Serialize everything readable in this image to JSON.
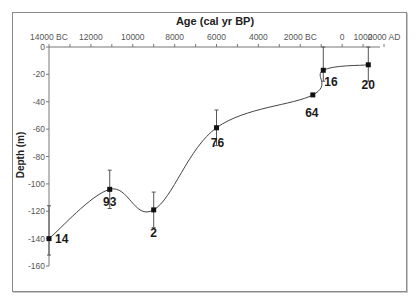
{
  "chart_data": {
    "type": "line",
    "title": "Age (cal yr BP)",
    "xlabel": "Age (cal yr BP)",
    "ylabel": "Depth (m)",
    "x_tick_labels": [
      "14000 BC",
      "12000",
      "10000",
      "8000",
      "6000",
      "4000",
      "2000 BC",
      "0",
      "1000",
      "2000 AD"
    ],
    "x_tick_values": [
      -14000,
      -12000,
      -10000,
      -8000,
      -6000,
      -4000,
      -2000,
      0,
      1000,
      2000
    ],
    "y_tick_labels": [
      "0",
      "-20",
      "-40",
      "-60",
      "-80",
      "-100",
      "-120",
      "-140",
      "-160"
    ],
    "y_tick_values": [
      0,
      -20,
      -40,
      -60,
      -80,
      -100,
      -120,
      -140,
      -160
    ],
    "xlim": [
      -14000,
      2000
    ],
    "ylim": [
      -160,
      0
    ],
    "x_axis_position": "top",
    "grid": false,
    "smoothed": true,
    "series": [
      {
        "name": "Relative sea level",
        "points": [
          {
            "label": "14",
            "x": -14000,
            "y": -140,
            "err_low": -152,
            "err_high": -116
          },
          {
            "label": "93",
            "x": -11100,
            "y": -104,
            "err_low": -118,
            "err_high": -90
          },
          {
            "label": "2",
            "x": -9000,
            "y": -119,
            "err_low": -132,
            "err_high": -106
          },
          {
            "label": "76",
            "x": -6000,
            "y": -59,
            "err_low": -72,
            "err_high": -46
          },
          {
            "label": "64",
            "x": -1400,
            "y": -35,
            "err_low": null,
            "err_high": null
          },
          {
            "label": "16",
            "x": -900,
            "y": -17,
            "err_low": -25,
            "err_high": 0
          },
          {
            "label": "20",
            "x": 1250,
            "y": -13,
            "err_low": -25,
            "err_high": 0
          }
        ]
      }
    ]
  }
}
